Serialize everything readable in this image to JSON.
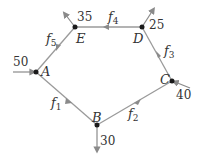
{
  "diagram": {
    "type": "flow-network",
    "nodes": [
      {
        "id": "A",
        "label": "A",
        "x": 36,
        "y": 72,
        "external": "50",
        "external_dir": "in"
      },
      {
        "id": "B",
        "label": "B",
        "x": 97,
        "y": 125,
        "external": "30",
        "external_dir": "out"
      },
      {
        "id": "C",
        "label": "C",
        "x": 172,
        "y": 81,
        "external": "40",
        "external_dir": "in"
      },
      {
        "id": "D",
        "label": "D",
        "x": 142,
        "y": 27,
        "external": "25",
        "external_dir": "out"
      },
      {
        "id": "E",
        "label": "E",
        "x": 75,
        "y": 27,
        "external": "35",
        "external_dir": "out"
      }
    ],
    "edges": [
      {
        "id": "f1",
        "label": "f",
        "sub": "1",
        "from": "A",
        "to": "B"
      },
      {
        "id": "f2",
        "label": "f",
        "sub": "2",
        "from": "B",
        "to": "C"
      },
      {
        "id": "f3",
        "label": "f",
        "sub": "3",
        "from": "C",
        "to": "D"
      },
      {
        "id": "f4",
        "label": "f",
        "sub": "4",
        "from": "D",
        "to": "E"
      },
      {
        "id": "f5",
        "label": "f",
        "sub": "5",
        "from": "E",
        "to": "A"
      }
    ]
  }
}
